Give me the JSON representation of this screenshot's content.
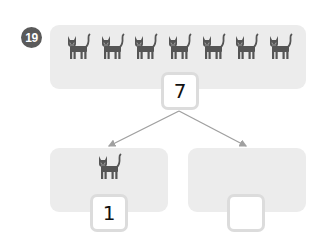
{
  "problem_number": "19",
  "total_group": {
    "cat_count": 7,
    "icon": "cat-icon",
    "value": "7"
  },
  "parts": [
    {
      "cat_count": 1,
      "icon": "cat-icon",
      "value": "1"
    },
    {
      "cat_count": 0,
      "icon": "cat-icon",
      "value": ""
    }
  ],
  "colors": {
    "panel": "#ececec",
    "cat": "#555555",
    "badge": "#5a5a5a",
    "arrow": "#a0a0a0",
    "box_border": "#dcdcdc"
  }
}
